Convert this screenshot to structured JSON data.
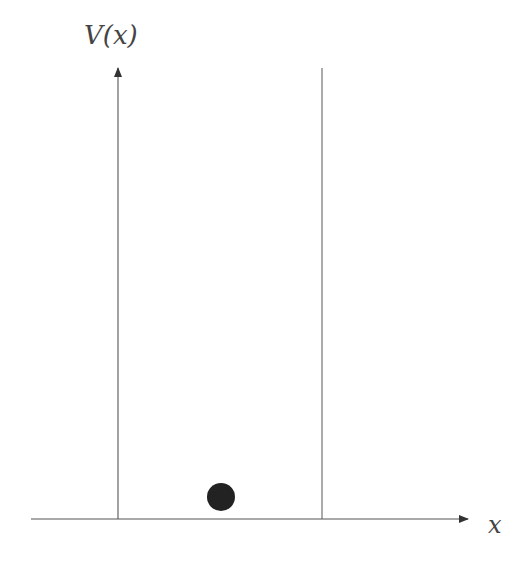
{
  "diagram": {
    "y_axis_label": "V(x)",
    "x_axis_label": "x",
    "colors": {
      "axis": "#444444",
      "wall": "#555555",
      "particle": "#222222",
      "background": "#ffffff"
    },
    "elements": [
      {
        "type": "arrow-axis",
        "name": "x-axis",
        "from": [
          31,
          519
        ],
        "to": [
          468,
          519
        ]
      },
      {
        "type": "arrow-axis",
        "name": "y-axis",
        "from": [
          118,
          519
        ],
        "to": [
          118,
          67
        ]
      },
      {
        "type": "wall",
        "name": "right-wall",
        "from": [
          322,
          68
        ],
        "to": [
          322,
          519
        ]
      },
      {
        "type": "particle",
        "name": "particle",
        "center": [
          221,
          497
        ],
        "radius": 14
      }
    ]
  }
}
